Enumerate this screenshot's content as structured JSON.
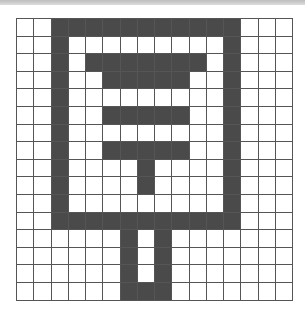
{
  "puzzle": {
    "rows": 16,
    "cols": 16,
    "fill_color": "#4a4a4a",
    "empty_color": "#ffffff",
    "grid_line_color": "#555555",
    "filled": [
      "0011111111111000",
      "0010000000001000",
      "0010111111101000",
      "0010011111001000",
      "0010000000001000",
      "0010011111001000",
      "0010000000001000",
      "0010011111001000",
      "0010000100001000",
      "0010000100001000",
      "0010000000001000",
      "0011111111111000",
      "0000001010000000",
      "0000001010000000",
      "0000001010000000",
      "0000001110000000"
    ]
  }
}
